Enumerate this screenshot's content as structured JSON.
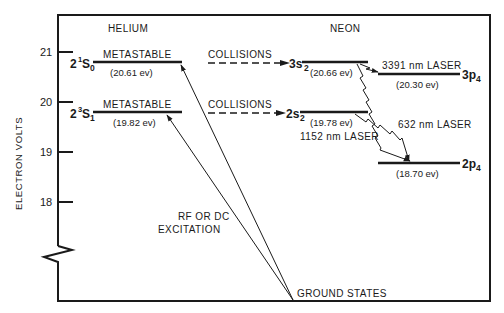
{
  "diagram": {
    "type": "energy-level-diagram",
    "y_axis": {
      "title": "ELECTRON VOLTS",
      "ticks": [
        "21",
        "20",
        "19",
        "18"
      ],
      "broken_axis": true
    },
    "columns": {
      "left": "HELIUM",
      "right": "NEON"
    },
    "helium_levels": [
      {
        "state": "2",
        "sup": "1",
        "letter": "S",
        "sub": "0",
        "tag": "METASTABLE",
        "energy": "(20.61 ev)"
      },
      {
        "state": "2",
        "sup": "3",
        "letter": "S",
        "sub": "1",
        "tag": "METASTABLE",
        "energy": "(19.82 ev)"
      }
    ],
    "neon_levels": [
      {
        "state": "3s",
        "sub": "2",
        "energy": "(20.66 ev)"
      },
      {
        "state": "2s",
        "sub": "2",
        "energy": "(19.78 ev)"
      },
      {
        "state": "3p",
        "sub": "4",
        "energy": "(20.30 ev)"
      },
      {
        "state": "2p",
        "sub": "4",
        "energy": "(18.70 ev)"
      }
    ],
    "transfer_labels": [
      "COLLISIONS",
      "COLLISIONS"
    ],
    "laser_labels": [
      "3391 nm LASER",
      "632 nm LASER",
      "1152 nm LASER"
    ],
    "excitation_label": [
      "RF OR DC",
      "EXCITATION"
    ],
    "ground_label": "GROUND STATES"
  }
}
